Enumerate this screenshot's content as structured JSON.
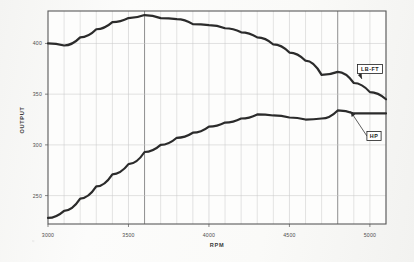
{
  "chart_data": {
    "type": "line",
    "title": "",
    "xlabel": "RPM",
    "ylabel": "OUTPUT",
    "xlim": [
      3000,
      5100
    ],
    "ylim": [
      222,
      432
    ],
    "grid": true,
    "x_ticks": [
      3000,
      3500,
      4000,
      4500,
      5000
    ],
    "x_tick_labels": [
      "3000",
      "3500",
      "4000",
      "4500",
      "5000"
    ],
    "x_minor_step": 100,
    "y_ticks": [
      250,
      300,
      350,
      400
    ],
    "y_tick_labels": [
      "250",
      "300",
      "350",
      "400"
    ],
    "emphasis_lines": [
      3600,
      4800
    ],
    "legend_position": "inline-callout-right",
    "x": [
      3000,
      3100,
      3200,
      3300,
      3400,
      3500,
      3600,
      3700,
      3800,
      3900,
      4000,
      4100,
      4200,
      4300,
      4400,
      4500,
      4600,
      4700,
      4800,
      4900,
      5000,
      5100
    ],
    "series": [
      {
        "name": "LB-FT",
        "label": "LB-FT",
        "values": [
          400,
          398,
          406,
          414,
          421,
          425,
          428,
          425,
          424,
          419,
          418,
          415,
          411,
          406,
          399,
          391,
          383,
          369,
          372,
          361,
          352,
          345
        ]
      },
      {
        "name": "HP",
        "label": "HP",
        "values": [
          228,
          235,
          247,
          259,
          271,
          281,
          293,
          300,
          307,
          312,
          318,
          322,
          326,
          330,
          329,
          327,
          325,
          326,
          334,
          331,
          331,
          331
        ]
      }
    ],
    "annotations": [
      {
        "text": "LB-FT",
        "points_to_rpm": 4950,
        "points_to_value": 365
      },
      {
        "text": "HP",
        "points_to_rpm": 4880,
        "points_to_value": 333
      }
    ],
    "colors": {
      "curve": "#2b2b2b",
      "grid_minor": "#c9c9c9",
      "grid_major": "#8e8e8e",
      "axis": "#555555",
      "text": "#3a3a3a",
      "background": "#fbfbfa"
    }
  }
}
